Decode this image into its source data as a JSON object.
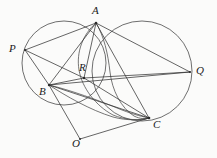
{
  "figure": {
    "width": 217,
    "height": 158,
    "background_color": "#fbfbfa",
    "stroke_color": "#3a3a3a"
  },
  "points": [
    {
      "id": "A",
      "label": "A",
      "x": 96,
      "y": 23,
      "label_x": 92,
      "label_y": 5,
      "role": "circle-intersection-top"
    },
    {
      "id": "P",
      "label": "P",
      "x": 25,
      "y": 50,
      "label_x": 9,
      "label_y": 43,
      "role": "left-circle-point"
    },
    {
      "id": "Q",
      "label": "Q",
      "x": 190,
      "y": 72,
      "label_x": 196,
      "label_y": 65,
      "role": "right-circle-point"
    },
    {
      "id": "R",
      "label": "R",
      "x": 84,
      "y": 78,
      "label_x": 79,
      "label_y": 62,
      "role": "interior-intersection"
    },
    {
      "id": "B",
      "label": "B",
      "x": 49,
      "y": 85,
      "label_x": 39,
      "label_y": 86,
      "role": "left-circle-point"
    },
    {
      "id": "C",
      "label": "C",
      "x": 149,
      "y": 118,
      "label_x": 153,
      "label_y": 119,
      "role": "lower-right-point"
    },
    {
      "id": "O",
      "label": "O",
      "x": 80,
      "y": 139,
      "label_x": 72,
      "label_y": 138,
      "role": "lower-vertex"
    }
  ],
  "circles": [
    {
      "id": "left-circle",
      "cx": 64,
      "cy": 63,
      "r": 42,
      "through": [
        "P",
        "A",
        "B",
        "R"
      ]
    },
    {
      "id": "right-circle",
      "cx": 142,
      "cy": 71,
      "r": 50,
      "through": [
        "A",
        "Q",
        "C"
      ]
    },
    {
      "id": "inner-circle",
      "cx": 101,
      "cy": 67,
      "r": 45,
      "through": [
        "A",
        "R",
        "C",
        "B"
      ]
    }
  ],
  "segments": [
    {
      "id": "P-A",
      "from": "P",
      "to": "A"
    },
    {
      "id": "P-B",
      "from": "P",
      "to": "B"
    },
    {
      "id": "P-R",
      "from": "P",
      "to": "R"
    },
    {
      "id": "A-B",
      "from": "A",
      "to": "B"
    },
    {
      "id": "A-R",
      "from": "A",
      "to": "R"
    },
    {
      "id": "A-C",
      "from": "A",
      "to": "C"
    },
    {
      "id": "A-Q",
      "from": "A",
      "to": "Q"
    },
    {
      "id": "B-Q",
      "from": "B",
      "to": "Q"
    },
    {
      "id": "B-R",
      "from": "B",
      "to": "R"
    },
    {
      "id": "B-C",
      "from": "B",
      "to": "C"
    },
    {
      "id": "B-O",
      "from": "B",
      "to": "O"
    },
    {
      "id": "R-C",
      "from": "R",
      "to": "C"
    },
    {
      "id": "R-Q",
      "from": "R",
      "to": "Q"
    },
    {
      "id": "O-C",
      "from": "O",
      "to": "C"
    }
  ],
  "arcs": [
    {
      "id": "arc-B-C-lower",
      "from": "B",
      "to": "C",
      "description": "arc bulging downward from B to C"
    },
    {
      "id": "arc-B-C-upper",
      "from": "B",
      "to": "C",
      "description": "second arc from B to C"
    }
  ],
  "labels": {
    "A": "A",
    "P": "P",
    "Q": "Q",
    "R": "R",
    "B": "B",
    "C": "C",
    "O": "O"
  }
}
